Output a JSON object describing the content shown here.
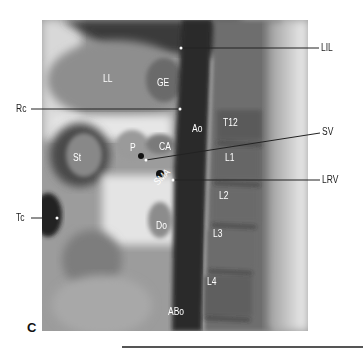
{
  "figure": {
    "panel_letter": "C",
    "internal_labels": [
      {
        "id": "LL",
        "text": "LL",
        "x": 103,
        "y": 74
      },
      {
        "id": "GE",
        "text": "GE",
        "x": 157,
        "y": 78
      },
      {
        "id": "Ao",
        "text": "Ao",
        "x": 192,
        "y": 124
      },
      {
        "id": "T12",
        "text": "T12",
        "x": 223,
        "y": 118
      },
      {
        "id": "P",
        "text": "P",
        "x": 130,
        "y": 143
      },
      {
        "id": "CA",
        "text": "CA",
        "x": 159,
        "y": 142
      },
      {
        "id": "St",
        "text": "St",
        "x": 73,
        "y": 153
      },
      {
        "id": "L1",
        "text": "L1",
        "x": 225,
        "y": 153
      },
      {
        "id": "SMA",
        "text": "SMA",
        "x": 152,
        "y": 172
      },
      {
        "id": "L2",
        "text": "L2",
        "x": 219,
        "y": 191
      },
      {
        "id": "Do",
        "text": "Do",
        "x": 156,
        "y": 221
      },
      {
        "id": "L3",
        "text": "L3",
        "x": 213,
        "y": 229
      },
      {
        "id": "L4",
        "text": "L4",
        "x": 207,
        "y": 277
      },
      {
        "id": "ABo",
        "text": "ABo",
        "x": 168,
        "y": 307
      }
    ],
    "external_labels": [
      {
        "id": "LIL",
        "text": "LIL",
        "x": 321,
        "y": 43
      },
      {
        "id": "Rc",
        "text": "Rc",
        "x": 18,
        "y": 104
      },
      {
        "id": "SV",
        "text": "SV",
        "x": 323,
        "y": 128
      },
      {
        "id": "LRV",
        "text": "LRV",
        "x": 322,
        "y": 175
      },
      {
        "id": "Tc",
        "text": "Tc",
        "x": 18,
        "y": 214
      }
    ]
  }
}
